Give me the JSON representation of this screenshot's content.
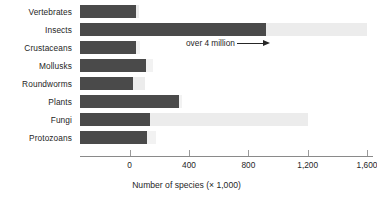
{
  "chart_data": {
    "type": "bar",
    "orientation": "horizontal",
    "title": "",
    "xlabel": "Number of species (× 1,000)",
    "ylabel": "",
    "categories": [
      "Vertebrates",
      "Insects",
      "Crustaceans",
      "Mollusks",
      "Roundworms",
      "Plants",
      "Fungi",
      "Protozoans"
    ],
    "values": [
      45,
      920,
      40,
      110,
      20,
      335,
      140,
      120
    ],
    "ghost_values": [
      60,
      2000,
      70,
      160,
      100,
      350,
      1200,
      180
    ],
    "xlim": [
      -335,
      1600
    ],
    "xticks": [
      0,
      400,
      800,
      1200,
      1600
    ],
    "xtick_labels": [
      "0",
      "400",
      "800",
      "1,200",
      "1,600"
    ],
    "grid": false,
    "legend": null,
    "annotations": [
      {
        "text": "over 4 million",
        "arrow": "right-arrow",
        "attached_to": "Insects"
      }
    ],
    "colors": {
      "bar_fill": "#4a4a4a",
      "bar_ghost": "#ececec",
      "bar_ghost_faint": "#f2f2f2",
      "axis": "#8a8a8a",
      "text": "#262626",
      "background": "#ffffff"
    }
  }
}
